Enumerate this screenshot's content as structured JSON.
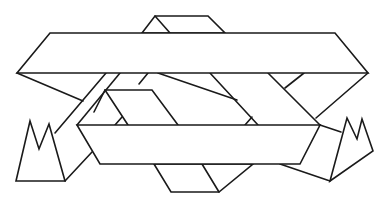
{
  "diagram": {
    "type": "line-drawing",
    "colors": {
      "stroke": "#1a1a1a",
      "background": "#ffffff"
    },
    "shapes": [
      {
        "name": "top-trapezoid",
        "points": "142,33 155,16 208,16 225,33"
      },
      {
        "name": "top-trapezoid-inner",
        "points": "155,16 170,33"
      },
      {
        "name": "upper-band",
        "points": "50,33 335,33 368,73 17,73"
      },
      {
        "name": "left-diagonal-outer",
        "points": "17,73 83,101"
      },
      {
        "name": "left-strut-a",
        "points": "106,73 55,133"
      },
      {
        "name": "left-strut-b",
        "points": "120,73 65,138"
      },
      {
        "name": "left-strut-c",
        "points": "57,139 77,125"
      },
      {
        "name": "lower-strut-bottom",
        "points": "65,181 92,152"
      },
      {
        "name": "inner-slab-top",
        "points": "92,101 105,90 152,90 178,125"
      },
      {
        "name": "inner-slab-left",
        "points": "105,90 127,125"
      },
      {
        "name": "inner-slab-tick",
        "points": "117,125 124,118"
      },
      {
        "name": "center-diagonal-a",
        "points": "158,73 150,85"
      },
      {
        "name": "center-diagonal-b",
        "points": "160,73 237,102 249,125"
      },
      {
        "name": "center-diagonal-c",
        "points": "210,73 255,125"
      },
      {
        "name": "center-tick",
        "points": "245,125 251,118"
      },
      {
        "name": "right-diagonal-a",
        "points": "263,73 320,125"
      },
      {
        "name": "right-diagonal-b",
        "points": "285,73 270,89"
      },
      {
        "name": "right-diagonal-c",
        "points": "368,73 316,118"
      },
      {
        "name": "lower-box",
        "points": "77,125 320,125 300,164 100,164"
      },
      {
        "name": "bottom-parallelogram",
        "points": "154,164 171,192 219,192 253,164"
      },
      {
        "name": "bottom-parallelogram-inner",
        "points": "202,164 219,192"
      },
      {
        "name": "right-connector",
        "points": "320,125 341,132"
      },
      {
        "name": "right-lower-edge",
        "points": "280,164 330,181"
      },
      {
        "name": "left-crown",
        "points": "16,181 30,121 39,149 49,124 65,181"
      },
      {
        "name": "right-crown",
        "points": "330,181 347,118 357,139 362,119 373,151"
      }
    ]
  }
}
